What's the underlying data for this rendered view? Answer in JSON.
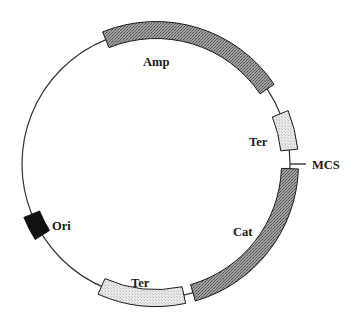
{
  "diagram": {
    "type": "plasmid-map",
    "backbone": {
      "center": [
        156,
        164
      ],
      "radius": 134,
      "stroke": "#333333"
    },
    "features": [
      {
        "id": "amp",
        "label": "Amp",
        "start_deg": 338,
        "end_deg": 416,
        "fill": "#8f8f8f",
        "pattern": "dark",
        "label_pos": [
          143,
          66
        ]
      },
      {
        "id": "ter-1",
        "label": "Ter",
        "start_deg": 68,
        "end_deg": 84,
        "fill": "#e2e2e2",
        "pattern": "light",
        "label_pos": [
          249,
          146
        ]
      },
      {
        "id": "cat",
        "label": "Cat",
        "start_deg": 92,
        "end_deg": 164,
        "fill": "#8f8f8f",
        "pattern": "dark",
        "label_pos": [
          233,
          236
        ]
      },
      {
        "id": "ter-2",
        "label": "Ter",
        "start_deg": 168,
        "end_deg": 204,
        "fill": "#e2e2e2",
        "pattern": "light",
        "label_pos": [
          131,
          287
        ]
      },
      {
        "id": "ori",
        "label": "Ori",
        "start_deg": 238,
        "end_deg": 248,
        "fill": "#111111",
        "pattern": "solid",
        "label_pos": [
          52,
          230
        ]
      }
    ],
    "sites": [
      {
        "id": "mcs",
        "label": "MCS",
        "angle_deg": 90,
        "tick_length": 16,
        "label_pos": [
          312,
          169
        ]
      }
    ]
  }
}
